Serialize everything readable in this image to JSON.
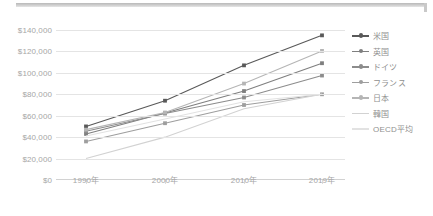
{
  "chart_data": {
    "type": "line",
    "title": "",
    "subtitle": "",
    "xlabel": "",
    "ylabel": "",
    "categories": [
      "1990年",
      "2000年",
      "2010年",
      "2019年"
    ],
    "ylim": [
      0,
      140000
    ],
    "ytick_values": [
      0,
      20000,
      40000,
      60000,
      80000,
      100000,
      120000,
      140000
    ],
    "ytick_labels": [
      "$0",
      "$20,000",
      "$40,000",
      "$60,000",
      "$80,000",
      "$100,000",
      "$120,000",
      "$140,000"
    ],
    "grid": true,
    "legend_position": "right",
    "currency_prefix": "$",
    "series": [
      {
        "name": "米国",
        "values": [
          50000,
          74000,
          107000,
          135000
        ],
        "color": "#595959",
        "markers": true
      },
      {
        "name": "英国",
        "values": [
          43000,
          62500,
          83000,
          109000
        ],
        "color": "#7f7f7f",
        "markers": true
      },
      {
        "name": "ドイツ",
        "values": [
          45500,
          62000,
          77000,
          97500
        ],
        "color": "#8c8c8c",
        "markers": true
      },
      {
        "name": "フランス",
        "values": [
          36000,
          53000,
          70000,
          80000
        ],
        "color": "#9e9e9e",
        "markers": true
      },
      {
        "name": "日本",
        "values": [
          47000,
          63000,
          90000,
          120500
        ],
        "color": "#b5b5b5",
        "markers": true
      },
      {
        "name": "韓国",
        "values": [
          20000,
          40000,
          66500,
          80000
        ],
        "color": "#d2d2d2",
        "markers": false
      },
      {
        "name": "OECD平均",
        "values": [
          41000,
          57000,
          73000,
          80000
        ],
        "color": "#e2e2e2",
        "markers": false
      }
    ]
  },
  "legend": {
    "items": [
      {
        "label": "米国"
      },
      {
        "label": "英国"
      },
      {
        "label": "ドイツ"
      },
      {
        "label": "フランス"
      },
      {
        "label": "日本"
      },
      {
        "label": "韓国"
      },
      {
        "label": "OECD平均"
      }
    ]
  }
}
